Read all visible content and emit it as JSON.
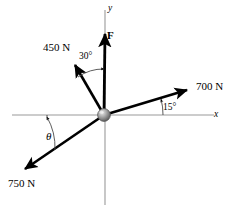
{
  "figure": {
    "type": "force-vector-diagram",
    "background_color": "#ffffff",
    "axes": {
      "x_label": "x",
      "y_label": "y",
      "axis_color": "#9a9a9a",
      "origin": {
        "x": 104,
        "y": 115,
        "marker": "gray-sphere"
      }
    },
    "vectors": [
      {
        "name": "F",
        "label": "F",
        "magnitude_text": "",
        "direction": "up (along +y)",
        "angle_deg_from_positive_x": 90,
        "color": "#000000",
        "tip": {
          "x": 105,
          "y": 31
        }
      },
      {
        "name": "force-450",
        "label": "450 N",
        "magnitude_text": "450 N",
        "direction": "up-left",
        "angle_deg_from_positive_x": 120,
        "color": "#000000",
        "tip": {
          "x": 72,
          "y": 62
        }
      },
      {
        "name": "force-700",
        "label": "700 N",
        "magnitude_text": "700 N",
        "direction": "up-right",
        "angle_deg_from_positive_x": 15,
        "color": "#000000",
        "tip": {
          "x": 191,
          "y": 88
        }
      },
      {
        "name": "force-750",
        "label": "750 N",
        "magnitude_text": "750 N",
        "direction": "down-left",
        "angle_deg_from_positive_x": 212,
        "color": "#000000",
        "tip": {
          "x": 21,
          "y": 172
        }
      }
    ],
    "angles": [
      {
        "name": "angle-30",
        "label": "30°",
        "between": "450 N vector and F"
      },
      {
        "name": "angle-15",
        "label": "15°",
        "between": "700 N vector and +x axis"
      },
      {
        "name": "angle-theta",
        "label": "θ",
        "between": "750 N vector and −x axis"
      }
    ],
    "labels": {
      "force_450": "450 N",
      "force_700": "700 N",
      "force_750": "750 N",
      "resultant_F": "F",
      "angle_30": "30°",
      "angle_15": "15°",
      "angle_theta": "θ",
      "axis_x": "x",
      "axis_y": "y"
    }
  }
}
